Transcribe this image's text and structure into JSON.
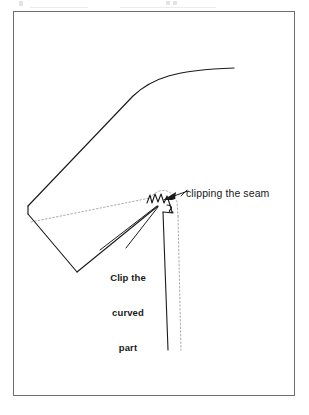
{
  "figure": {
    "kind": "sewing-instruction-illustration",
    "background_color": "#ffffff",
    "frame": {
      "name": "figure-border",
      "stroke_color": "#6e6e6e",
      "stroke_width": 1,
      "x": 13,
      "y": 11,
      "width": 282,
      "height": 385
    },
    "ink_color": "#1a1a1a",
    "seam_line_color": "#a9a9a9",
    "labels": {
      "clipping_seam": "clipping the seam",
      "clip_curved": {
        "line1": "Clip the",
        "line2": "curved",
        "line3": "part"
      }
    },
    "annotations": {
      "arrow": {
        "name": "arrow-to-clip",
        "from_x": 186,
        "from_y": 192,
        "to_x": 160,
        "to_y": 200
      },
      "leader_lines": 2
    },
    "clip_notches": 4
  }
}
